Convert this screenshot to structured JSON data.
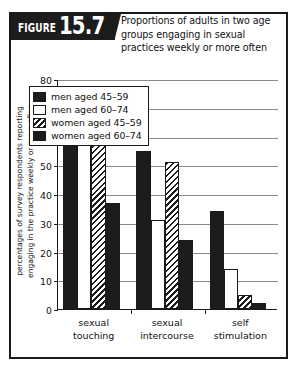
{
  "figure": {
    "badge_word": "FIGURE",
    "number": "15.7",
    "caption": "Proportions of adults in two age groups engaging in sexual practices weekly or more often"
  },
  "chart_data": {
    "type": "bar",
    "title": "Proportions of adults in two age groups engaging in sexual practices weekly or more often",
    "xlabel": "",
    "ylabel": "percentages of survey respondents reporting engaging in the practice weekly or more often",
    "ylim": [
      0,
      80
    ],
    "yticks": [
      0,
      10,
      20,
      30,
      40,
      50,
      60,
      70,
      80
    ],
    "grid": true,
    "legend_position": "upper-left-inside",
    "categories": [
      "sexual touching",
      "sexual intercourse",
      "self stimulation"
    ],
    "series": [
      {
        "name": "men aged 45–59",
        "pattern": "solid",
        "values": [
          69,
          55,
          34
        ]
      },
      {
        "name": "men aged 60–74",
        "pattern": "open",
        "values": [
          62,
          31,
          14
        ]
      },
      {
        "name": "women aged 45–59",
        "pattern": "hatch",
        "values": [
          63,
          51,
          5
        ]
      },
      {
        "name": "women aged 60–74",
        "pattern": "solid",
        "values": [
          37,
          24,
          2
        ]
      }
    ]
  },
  "colors": {
    "ink": "#1c1c1c",
    "grid": "#8a8a8a",
    "paper": "#ffffff"
  }
}
